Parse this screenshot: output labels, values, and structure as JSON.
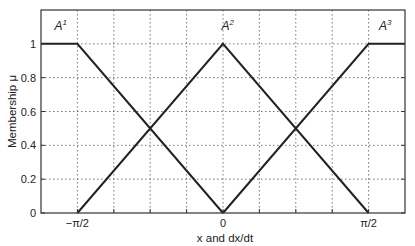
{
  "chart_data": {
    "type": "line",
    "title": "",
    "xlabel": "x and dx/dt",
    "ylabel": "Membership μ",
    "xlim": [
      -1.9635,
      1.9635
    ],
    "ylim": [
      0,
      1.2
    ],
    "grid": true,
    "x_ticks": [
      {
        "value": -1.5708,
        "label": "−π/2"
      },
      {
        "value": 0,
        "label": "0"
      },
      {
        "value": 1.5708,
        "label": "π/2"
      }
    ],
    "x_gridlines": [
      -1.5708,
      -1.1781,
      -0.7854,
      -0.3927,
      0,
      0.3927,
      0.7854,
      1.1781,
      1.5708
    ],
    "y_ticks": [
      {
        "value": 0,
        "label": "0"
      },
      {
        "value": 0.2,
        "label": "0.2"
      },
      {
        "value": 0.4,
        "label": "0.4"
      },
      {
        "value": 0.6,
        "label": "0.6"
      },
      {
        "value": 0.8,
        "label": "0.8"
      },
      {
        "value": 1,
        "label": "1"
      }
    ],
    "series": [
      {
        "name": "A1",
        "label_base": "A",
        "label_sup": "1",
        "x": [
          -1.9635,
          -1.5708,
          0
        ],
        "y": [
          1,
          1,
          0
        ]
      },
      {
        "name": "A2",
        "label_base": "A",
        "label_sup": "2",
        "x": [
          -1.5708,
          0,
          1.5708
        ],
        "y": [
          0,
          1,
          0
        ]
      },
      {
        "name": "A3",
        "label_base": "A",
        "label_sup": "3",
        "x": [
          0,
          1.5708,
          1.9635
        ],
        "y": [
          0,
          1,
          1
        ]
      }
    ],
    "annotations": [
      {
        "text": "A1",
        "x": -1.75,
        "y": 1.08
      },
      {
        "text": "A2",
        "x": 0.05,
        "y": 1.08
      },
      {
        "text": "A3",
        "x": 1.75,
        "y": 1.08
      }
    ]
  },
  "colors": {
    "line": "#222222",
    "grid": "#555555",
    "axes": "#333333"
  }
}
